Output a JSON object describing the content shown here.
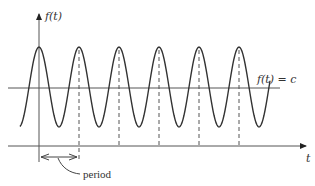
{
  "diagram": {
    "y_axis_label": "f(t)",
    "x_axis_label": "t",
    "level_label": "f(t) = c",
    "period_label": "period",
    "colors": {
      "line": "#444444",
      "text": "#333333",
      "background": "#ffffff"
    }
  },
  "geometry": {
    "y_axis_x": 39,
    "t_axis_y": 146,
    "midline_y": 88,
    "peak_y": 47,
    "trough_y": 127,
    "period_px": 40,
    "peaks_x": [
      39,
      79,
      119,
      159,
      199,
      239
    ]
  }
}
